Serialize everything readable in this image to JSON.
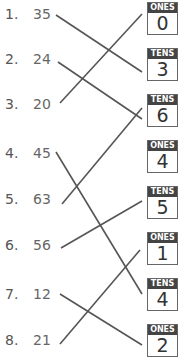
{
  "left_items": [
    {
      "index": "1.",
      "value": "35"
    },
    {
      "index": "2.",
      "value": "24"
    },
    {
      "index": "3.",
      "value": "20"
    },
    {
      "index": "4.",
      "value": "45"
    },
    {
      "index": "5.",
      "value": "63"
    },
    {
      "index": "6.",
      "value": "56"
    },
    {
      "index": "7.",
      "value": "12"
    },
    {
      "index": "8.",
      "value": "21"
    }
  ],
  "right_boxes": [
    {
      "place": "ONES",
      "digit": "0"
    },
    {
      "place": "TENS",
      "digit": "3"
    },
    {
      "place": "TENS",
      "digit": "6"
    },
    {
      "place": "ONES",
      "digit": "4"
    },
    {
      "place": "TENS",
      "digit": "5"
    },
    {
      "place": "ONES",
      "digit": "1"
    },
    {
      "place": "TENS",
      "digit": "4"
    },
    {
      "place": "ONES",
      "digit": "2"
    }
  ],
  "connections": [
    {
      "from": 1,
      "to": 2
    },
    {
      "from": 2,
      "to": 4
    },
    {
      "from": 3,
      "to": 1
    },
    {
      "from": 4,
      "to": 7
    },
    {
      "from": 5,
      "to": 3
    },
    {
      "from": 6,
      "to": 5
    },
    {
      "from": 7,
      "to": 8
    },
    {
      "from": 8,
      "to": 6
    }
  ],
  "colors": {
    "line": "#555555",
    "tag_bg": "#444444",
    "box_border": "#666666"
  }
}
